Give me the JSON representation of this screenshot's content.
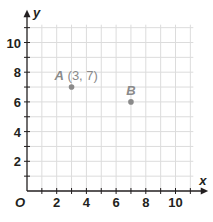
{
  "chart_data": {
    "type": "scatter",
    "title": "",
    "xlabel": "x",
    "ylabel": "y",
    "origin_label": "O",
    "xlim": [
      0,
      11
    ],
    "ylim": [
      0,
      11
    ],
    "grid": true,
    "x_ticks": [
      2,
      4,
      6,
      8,
      10
    ],
    "y_ticks": [
      2,
      4,
      6,
      8,
      10
    ],
    "points": [
      {
        "name": "A",
        "x": 3,
        "y": 7,
        "label": "A",
        "coords_label": "(3, 7)"
      },
      {
        "name": "B",
        "x": 7,
        "y": 6,
        "label": "B",
        "coords_label": ""
      }
    ]
  },
  "colors": {
    "axis": "#231f20",
    "grid": "#dcdcdc",
    "point": "#8a8a8a",
    "point_label": "#8a8a8a"
  }
}
